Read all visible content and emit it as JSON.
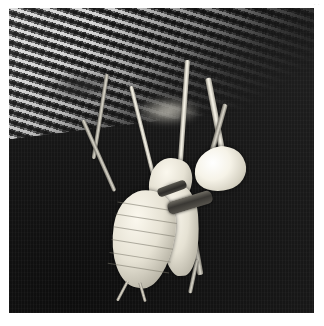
{
  "page": {
    "background_color": "#ffffff",
    "width": 324,
    "height": 326,
    "corner_mark": "· ·"
  },
  "photo": {
    "alt_text": "Praying mantis hanging upside down from a metal mesh screen",
    "medium": "black-and-white photograph",
    "frame": {
      "left": 9,
      "top": 8,
      "width": 305,
      "height": 305
    },
    "background_color": "#141414",
    "subject_color": "#efebdd",
    "mesh_color": "#b4b1a8",
    "regions": [
      {
        "name": "mesh-screen",
        "description": "Diagonal expanded-metal lattice across the upper left, fading into darkness toward the right"
      },
      {
        "name": "dark-background",
        "description": "Deep shadowed background filling the lower two thirds"
      },
      {
        "name": "insect",
        "description": "Pale insect suspended head-down, gripping the mesh with long slender legs"
      }
    ]
  },
  "insect": {
    "parts": [
      {
        "name": "head",
        "label": "head"
      },
      {
        "name": "thorax",
        "label": "thorax"
      },
      {
        "name": "abdomen",
        "label": "abdomen"
      },
      {
        "name": "wing-pad",
        "label": "wing pad"
      },
      {
        "name": "foreleg-marking",
        "label": "dark banded foreleg"
      },
      {
        "name": "cerci",
        "label": "cerci"
      }
    ],
    "legs": [
      {
        "name": "leg-front-left"
      },
      {
        "name": "leg-front-right"
      },
      {
        "name": "leg-mid-left"
      },
      {
        "name": "leg-mid-right"
      },
      {
        "name": "leg-hind-left"
      },
      {
        "name": "leg-hind-right"
      }
    ]
  }
}
